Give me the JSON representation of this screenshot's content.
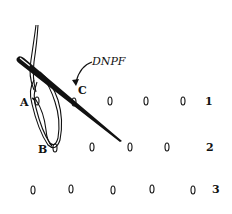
{
  "diagram": {
    "needle_label": "DNPF",
    "points": {
      "A": "A",
      "B": "B",
      "C": "C"
    },
    "rows": [
      {
        "number": "1"
      },
      {
        "number": "2"
      },
      {
        "number": "3"
      }
    ],
    "colors": {
      "ink": "#111111",
      "background": "#ffffff"
    }
  }
}
